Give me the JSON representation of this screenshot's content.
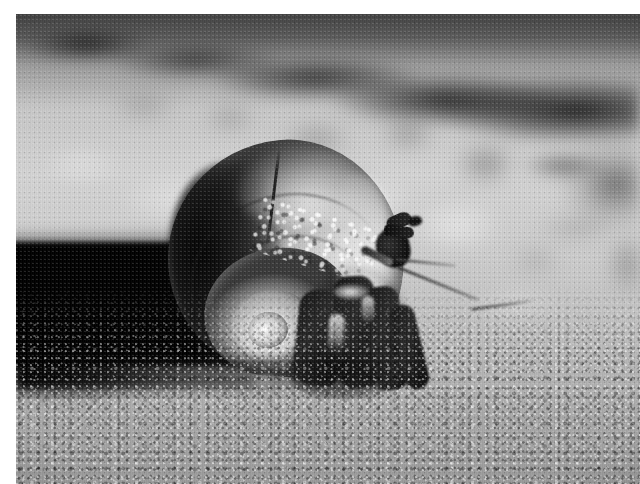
{
  "document": {
    "type": "photograph",
    "title": "Hermit crab in a snail shell on sand",
    "color_mode": "black-and-white",
    "width_px": 640,
    "height_px": 484,
    "border": {
      "color": "#ffffff",
      "left_px": 16,
      "top_px": 14,
      "right_px": 0,
      "bottom_px": 0
    }
  },
  "photo": {
    "subject": "hermit-crab-in-snail-shell",
    "scene": "sunlit sandy ground with blurred rocky background",
    "focus": "shell and crab legs in focus, background out of focus",
    "lighting": "hard directional sunlight from upper right casting a dark shadow to the left",
    "palette": {
      "deep_shadow": "#070707",
      "dark_mid": "#2b2b2b",
      "mid_grey": "#8c8c8c",
      "light_sand": "#cfcfcf",
      "highlight": "#f2f2f2",
      "frame_white": "#ffffff"
    },
    "elements": [
      {
        "name": "background-rock-band",
        "description": "blurred dark rocky band across the upper portion",
        "region": "top"
      },
      {
        "name": "sand-ground",
        "description": "coarse granular sunlit sand filling the lower half",
        "region": "bottom"
      },
      {
        "name": "cast-shadow",
        "description": "hard black shadow cast left of the shell",
        "region": "left-middle"
      },
      {
        "name": "snail-shell",
        "description": "spiral globular snail shell with visible whorls and suture line",
        "region": "center-left"
      },
      {
        "name": "shell-spiral-coil",
        "description": "tightly coiled spire with bright nucleus at its center",
        "region": "center-left-lower"
      },
      {
        "name": "shell-nodule-band",
        "description": "row of pale nodules along the shell shoulder",
        "region": "center"
      },
      {
        "name": "crab-legs",
        "description": "four dark walking legs emerging from the shell aperture",
        "region": "center-right-lower"
      },
      {
        "name": "crab-claw",
        "description": "dark pincer claw raised above the legs",
        "region": "center-right-upper"
      },
      {
        "name": "crab-antenna",
        "description": "long pale antenna bending down and to the right",
        "region": "right"
      }
    ]
  }
}
